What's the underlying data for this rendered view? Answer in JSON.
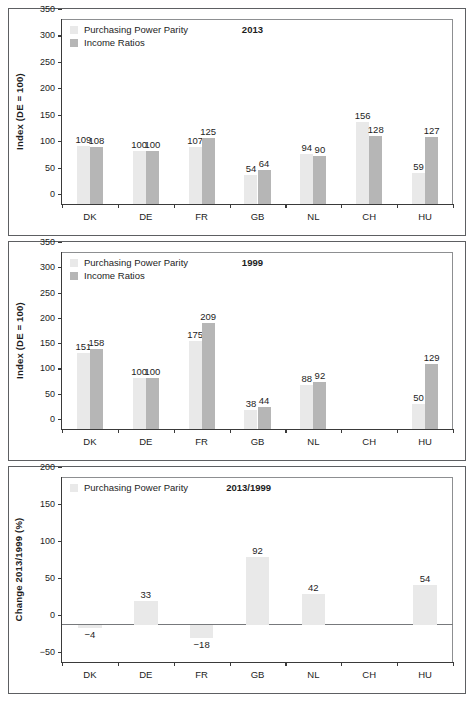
{
  "legend": {
    "ppp_label": "Purchasing Power Parity",
    "income_label": "Income Ratios",
    "ppp_swatch_name": "ppp-swatch",
    "income_swatch_name": "income-swatch"
  },
  "colors": {
    "ppp": "#e9e9e9",
    "income": "#b6b6b6",
    "axis": "#3a3a3a",
    "panel_border": "#5d5f62",
    "text": "#1d1d1d",
    "zero_line": "#77797c"
  },
  "panels": [
    {
      "id": "panel-2013",
      "title": "2013",
      "title_left_pct": 46,
      "legend_rows": [
        "ppp",
        "income"
      ]
    },
    {
      "id": "panel-1999",
      "title": "1999",
      "title_left_pct": 46,
      "legend_rows": [
        "ppp",
        "income"
      ]
    },
    {
      "id": "panel-change",
      "title": "2013/1999",
      "title_left_pct": 42,
      "legend_rows": [
        "ppp"
      ]
    }
  ],
  "chart_data": [
    {
      "type": "bar",
      "id": "panel-2013",
      "title": "2013",
      "xlabel": "",
      "ylabel": "Index (DE = 100)",
      "ylim": [
        0,
        350
      ],
      "yticks": [
        0,
        50,
        100,
        150,
        200,
        250,
        300,
        350
      ],
      "grid": false,
      "legend_position": "top-left",
      "categories": [
        "DK",
        "DE",
        "FR",
        "GB",
        "NL",
        "CH",
        "HU"
      ],
      "series": [
        {
          "name": "Purchasing Power Parity",
          "values": [
            109,
            100,
            107,
            54,
            94,
            156,
            59
          ]
        },
        {
          "name": "Income Ratios",
          "values": [
            108,
            100,
            125,
            64,
            90,
            128,
            127
          ]
        }
      ]
    },
    {
      "type": "bar",
      "id": "panel-1999",
      "title": "1999",
      "xlabel": "",
      "ylabel": "Index (DE = 100)",
      "ylim": [
        0,
        350
      ],
      "yticks": [
        0,
        50,
        100,
        150,
        200,
        250,
        300,
        350
      ],
      "grid": false,
      "legend_position": "top-left",
      "categories": [
        "DK",
        "DE",
        "FR",
        "GB",
        "NL",
        "CH",
        "HU"
      ],
      "series": [
        {
          "name": "Purchasing Power Parity",
          "values": [
            151,
            100,
            175,
            38,
            88,
            null,
            50
          ]
        },
        {
          "name": "Income Ratios",
          "values": [
            158,
            100,
            209,
            44,
            92,
            null,
            129
          ]
        }
      ]
    },
    {
      "type": "bar",
      "id": "panel-change",
      "title": "2013/1999",
      "xlabel": "",
      "ylabel": "Change 2013/1999 (%)",
      "ylim": [
        -50,
        200
      ],
      "yticks": [
        -50,
        0,
        50,
        100,
        150,
        200
      ],
      "grid": false,
      "legend_position": "top-left",
      "categories": [
        "DK",
        "DE",
        "FR",
        "GB",
        "NL",
        "CH",
        "HU"
      ],
      "series": [
        {
          "name": "Purchasing Power Parity",
          "values": [
            -4,
            33,
            -18,
            92,
            42,
            null,
            54
          ]
        }
      ],
      "value_labels": [
        "−4",
        "33",
        "−18",
        "92",
        "42",
        "",
        "54"
      ]
    }
  ]
}
